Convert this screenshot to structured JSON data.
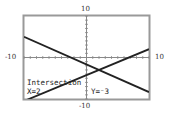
{
  "chart_data": {
    "type": "line",
    "title": "",
    "xlabel": "",
    "ylabel": "",
    "xlim": [
      -10,
      10
    ],
    "ylim": [
      -10,
      10
    ],
    "grid": false,
    "tick_labels": {
      "x_min": "-10",
      "x_max": "10",
      "y_min": "-10",
      "y_max": "10"
    },
    "series": [
      {
        "name": "line1",
        "equation": "y = -2/3x - 5/3",
        "points": [
          [
            -10,
            5
          ],
          [
            10,
            -8.33
          ]
        ]
      },
      {
        "name": "line2",
        "equation": "y = 5/8x - 17/4",
        "points": [
          [
            -10,
            -10.5
          ],
          [
            10,
            2
          ]
        ]
      }
    ],
    "annotation": {
      "label": "Intersection",
      "x_text": "X=2",
      "y_text": "Y=⁻3",
      "point": [
        2,
        -3
      ]
    }
  },
  "labels": {
    "ymax": "10",
    "ymin": "-10",
    "xmin": "-10",
    "xmax": "10"
  },
  "overlay": {
    "title": "Intersection",
    "x": "X=2",
    "y": "Y=⁻3"
  }
}
